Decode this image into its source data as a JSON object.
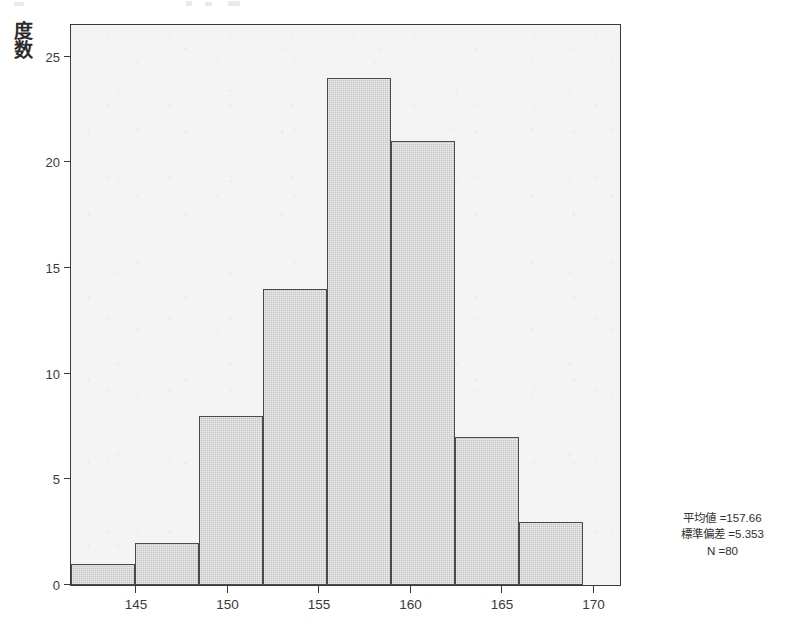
{
  "chart_data": {
    "type": "bar",
    "title": "",
    "subtitle": "",
    "xlabel": "",
    "ylabel": "度数",
    "categories": [
      "141.5",
      "145.0",
      "148.5",
      "152.0",
      "155.5",
      "159.0",
      "162.5",
      "166.0"
    ],
    "bin_edges": [
      141.5,
      145.0,
      148.5,
      152.0,
      155.5,
      159.0,
      162.5,
      166.0,
      169.5
    ],
    "values": [
      1,
      2,
      8,
      14,
      24,
      21,
      7,
      3
    ],
    "xlim": [
      141.5,
      171.5
    ],
    "ylim": [
      0,
      26.5
    ],
    "x_ticks": [
      "145",
      "150",
      "155",
      "160",
      "165",
      "170"
    ],
    "x_tick_values": [
      145,
      150,
      155,
      160,
      165,
      170
    ],
    "y_ticks": [
      "0",
      "5",
      "10",
      "15",
      "20",
      "25"
    ],
    "y_tick_values": [
      0,
      5,
      10,
      15,
      20,
      25
    ],
    "grid": false,
    "legend": "none",
    "bar_fill_color": "#c9c9c9",
    "bar_edge_color": "#4a4a4a",
    "plot_background_color": "#f4f4f4",
    "axis_color": "#3a3a3a"
  },
  "annotation": {
    "mean_label": "平均値 =157.66",
    "std_label": "標準偏差 =5.353",
    "n_label": "N =80",
    "mean_value": 157.66,
    "std_value": 5.353,
    "n_value": 80
  },
  "y_axis_title_chars": [
    "度",
    "数"
  ]
}
